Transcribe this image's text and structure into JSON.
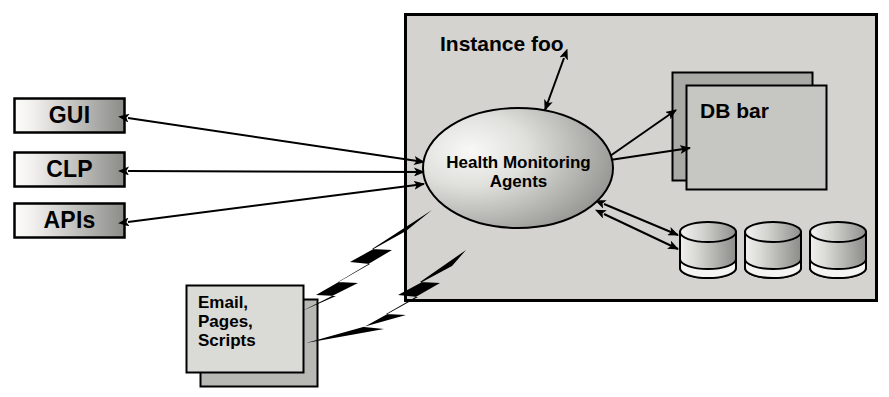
{
  "diagram": {
    "container": {
      "label": "Instance foo",
      "x": 405,
      "y": 14,
      "w": 472,
      "h": 287,
      "fill": "#d4d3cf",
      "stroke": "#000000"
    },
    "colors": {
      "page_background": "#ffffff",
      "container_fill": "#d4d3cf",
      "box_gradient_light": "#fbfbfa",
      "box_gradient_dark": "#8d8d8a",
      "ellipse_light": "#f2f2f0",
      "ellipse_dark": "#8f8f8c",
      "db_back_fill": "#a6a6a3",
      "db_front_fill": "#c3c3bf",
      "cylinder_light": "#ececea",
      "cylinder_dark": "#909090",
      "email_front_fill": "#d8d8d4",
      "email_back_fill": "#b6b6b2",
      "stroke": "#000000",
      "bolt_fill": "#000000"
    },
    "left_boxes": [
      {
        "id": "gui",
        "label": "GUI",
        "x": 14,
        "y": 98,
        "w": 111,
        "h": 35
      },
      {
        "id": "clp",
        "label": "CLP",
        "x": 14,
        "y": 152,
        "w": 111,
        "h": 35
      },
      {
        "id": "apis",
        "label": "APIs",
        "x": 14,
        "y": 203,
        "w": 111,
        "h": 35
      }
    ],
    "ellipse": {
      "label_line1": "Health Monitoring",
      "label_line2": "Agents",
      "cx": 518,
      "cy": 168,
      "rx": 95,
      "ry": 60
    },
    "db_bar": {
      "label": "DB bar",
      "back": {
        "x": 672,
        "y": 72,
        "w": 141,
        "h": 109
      },
      "front": {
        "x": 686,
        "y": 85,
        "w": 141,
        "h": 105
      }
    },
    "cylinders": [
      {
        "id": "cyl-1",
        "x": 680,
        "y": 222,
        "w": 56,
        "h": 54
      },
      {
        "id": "cyl-2",
        "x": 745,
        "y": 222,
        "w": 56,
        "h": 54
      },
      {
        "id": "cyl-3",
        "x": 810,
        "y": 222,
        "w": 56,
        "h": 54
      }
    ],
    "email_box": {
      "label_line1": "Email,",
      "label_line2": "Pages,",
      "label_line3": "Scripts",
      "front": {
        "x": 186,
        "y": 285,
        "w": 118,
        "h": 88
      },
      "back": {
        "x": 200,
        "y": 299,
        "w": 118,
        "h": 88
      }
    },
    "connectors": [
      {
        "id": "gui-to-agents",
        "from": "gui",
        "to": "agents",
        "style": "double-arrow"
      },
      {
        "id": "clp-to-agents",
        "from": "clp",
        "to": "agents",
        "style": "double-arrow"
      },
      {
        "id": "apis-to-agents",
        "from": "apis",
        "to": "agents",
        "style": "double-arrow"
      },
      {
        "id": "instance-label-to-agents",
        "from": "instance-foo",
        "to": "agents",
        "style": "double-arrow"
      },
      {
        "id": "agents-to-dbbar-upper",
        "from": "agents",
        "to": "db-bar",
        "style": "arrow"
      },
      {
        "id": "agents-to-dbbar-lower",
        "from": "db-bar",
        "to": "agents",
        "style": "arrow"
      },
      {
        "id": "agents-to-cyl-upper",
        "from": "agents",
        "to": "cylinders",
        "style": "arrow"
      },
      {
        "id": "agents-to-cyl-lower",
        "from": "cylinders",
        "to": "agents",
        "style": "arrow"
      },
      {
        "id": "bolt-upper",
        "from": "agents",
        "to": "email-box",
        "style": "lightning-bolt"
      },
      {
        "id": "bolt-lower",
        "from": "agents",
        "to": "email-box",
        "style": "lightning-bolt"
      }
    ]
  }
}
